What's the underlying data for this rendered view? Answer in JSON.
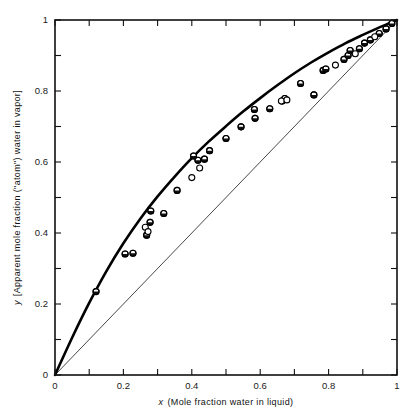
{
  "chart_data": {
    "type": "scatter",
    "title": "",
    "xlabel": "x (Mole fraction water in liquid)",
    "ylabel": "y [Apparent mole fraction (\"atom\") water in vapor]",
    "xlabel_symbol": "x",
    "xlabel_rest": "(Mole fraction water in liquid)",
    "ylabel_symbol": "y",
    "ylabel_rest": "[Apparent mole fraction (\"atom\") water in vapor]",
    "xlim": [
      0,
      1
    ],
    "ylim": [
      0,
      1
    ],
    "grid": false,
    "legend": "none",
    "x_ticks": [
      0,
      0.1,
      0.2,
      0.3,
      0.4,
      0.5,
      0.6,
      0.7,
      0.8,
      0.9,
      1
    ],
    "y_ticks": [
      0,
      0.1,
      0.2,
      0.3,
      0.4,
      0.5,
      0.6,
      0.7,
      0.8,
      0.9,
      1
    ],
    "x_tick_labels": [
      "0",
      "0.2",
      "0.4",
      "0.6",
      "0.8",
      "1"
    ],
    "x_tick_label_values": [
      0,
      0.2,
      0.4,
      0.6,
      0.8,
      1
    ],
    "y_tick_labels": [
      "0",
      "0.2",
      "0.4",
      "0.6",
      "0.8",
      "1"
    ],
    "y_tick_label_values": [
      0,
      0.2,
      0.4,
      0.6,
      0.8,
      1
    ],
    "ticks_inward": true,
    "frame_all_sides": true,
    "series": [
      {
        "name": "equilibrium-curve",
        "type": "line",
        "style": "thick-solid",
        "color": "#000000",
        "points": [
          [
            0.0,
            0.0
          ],
          [
            0.05,
            0.105
          ],
          [
            0.1,
            0.203
          ],
          [
            0.15,
            0.292
          ],
          [
            0.2,
            0.371
          ],
          [
            0.25,
            0.441
          ],
          [
            0.3,
            0.503
          ],
          [
            0.35,
            0.559
          ],
          [
            0.4,
            0.611
          ],
          [
            0.45,
            0.658
          ],
          [
            0.5,
            0.701
          ],
          [
            0.55,
            0.742
          ],
          [
            0.6,
            0.78
          ],
          [
            0.65,
            0.816
          ],
          [
            0.7,
            0.85
          ],
          [
            0.75,
            0.881
          ],
          [
            0.8,
            0.909
          ],
          [
            0.85,
            0.935
          ],
          [
            0.9,
            0.958
          ],
          [
            0.95,
            0.98
          ],
          [
            1.0,
            1.0
          ]
        ]
      },
      {
        "name": "diagonal-reference",
        "type": "line",
        "style": "thin-solid",
        "color": "#333333",
        "points": [
          [
            0.0,
            0.0
          ],
          [
            1.0,
            1.0
          ]
        ]
      },
      {
        "name": "data-points-half-filled",
        "type": "scatter",
        "marker": "half-filled-circle",
        "color": "#111111",
        "points": [
          [
            0.12,
            0.235
          ],
          [
            0.205,
            0.341
          ],
          [
            0.228,
            0.343
          ],
          [
            0.268,
            0.394
          ],
          [
            0.278,
            0.43
          ],
          [
            0.28,
            0.462
          ],
          [
            0.318,
            0.455
          ],
          [
            0.357,
            0.52
          ],
          [
            0.418,
            0.605
          ],
          [
            0.405,
            0.617
          ],
          [
            0.437,
            0.608
          ],
          [
            0.452,
            0.632
          ],
          [
            0.5,
            0.666
          ],
          [
            0.544,
            0.699
          ],
          [
            0.585,
            0.723
          ],
          [
            0.583,
            0.748
          ],
          [
            0.628,
            0.75
          ],
          [
            0.664,
            0.772
          ],
          [
            0.672,
            0.779
          ],
          [
            0.718,
            0.821
          ],
          [
            0.757,
            0.789
          ],
          [
            0.784,
            0.858
          ],
          [
            0.792,
            0.862
          ],
          [
            0.845,
            0.889
          ],
          [
            0.857,
            0.9
          ],
          [
            0.863,
            0.914
          ],
          [
            0.89,
            0.919
          ],
          [
            0.905,
            0.935
          ],
          [
            0.922,
            0.944
          ],
          [
            0.948,
            0.962
          ],
          [
            0.968,
            0.975
          ],
          [
            0.985,
            0.99
          ]
        ]
      },
      {
        "name": "data-points-open",
        "type": "scatter",
        "marker": "open-circle",
        "color": "#111111",
        "points": [
          [
            0.264,
            0.416
          ],
          [
            0.272,
            0.404
          ],
          [
            0.4,
            0.556
          ],
          [
            0.423,
            0.583
          ],
          [
            0.662,
            0.772
          ],
          [
            0.678,
            0.775
          ],
          [
            0.82,
            0.873
          ],
          [
            0.878,
            0.905
          ],
          [
            0.935,
            0.953
          ]
        ]
      }
    ]
  }
}
